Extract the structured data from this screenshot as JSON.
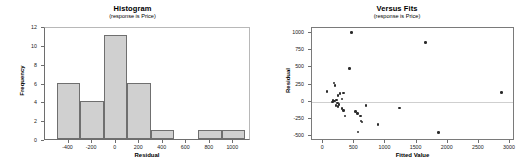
{
  "chart_data": [
    {
      "type": "bar",
      "title": "Histogram",
      "subtitle": "(response is Price)",
      "xlabel": "Residual",
      "ylabel": "Frequency",
      "xlim": [
        -600,
        1150
      ],
      "ylim": [
        0,
        12
      ],
      "grid": false,
      "legend": "none",
      "xticks": [
        "-400",
        "-200",
        "0",
        "200",
        "400",
        "600",
        "800",
        "1000"
      ],
      "xtick_values": [
        -400,
        -200,
        0,
        200,
        400,
        600,
        800,
        1000
      ],
      "yticks": [
        "0",
        "2",
        "4",
        "6",
        "8",
        "10",
        "12"
      ],
      "ytick_values": [
        0,
        2,
        4,
        6,
        8,
        10,
        12
      ],
      "bin_width": 200,
      "bins": [
        {
          "left": -500,
          "right": -300,
          "center": -400,
          "frequency": 6
        },
        {
          "left": -300,
          "right": -100,
          "center": -200,
          "frequency": 4
        },
        {
          "left": -100,
          "right": 100,
          "center": 0,
          "frequency": 11
        },
        {
          "left": 100,
          "right": 300,
          "center": 200,
          "frequency": 6
        },
        {
          "left": 300,
          "right": 500,
          "center": 400,
          "frequency": 1
        },
        {
          "left": 700,
          "right": 900,
          "center": 800,
          "frequency": 1
        },
        {
          "left": 900,
          "right": 1100,
          "center": 1000,
          "frequency": 1
        }
      ],
      "categories": [
        "-400",
        "-200",
        "0",
        "200",
        "400",
        "800",
        "1000"
      ],
      "values": [
        6,
        4,
        11,
        6,
        1,
        1,
        1
      ],
      "bar_fill_color": "#d0d0d0",
      "bar_edge_color": "#6f6f6f"
    },
    {
      "type": "scatter",
      "title": "Versus Fits",
      "subtitle": "(response is Price)",
      "xlabel": "Fitted Value",
      "ylabel": "Residual",
      "xlim": [
        -180,
        3080
      ],
      "ylim": [
        -580,
        1080
      ],
      "grid": false,
      "legend": "none",
      "reference_line_y": 0,
      "xticks": [
        "0",
        "500",
        "1000",
        "1500",
        "2000",
        "2500",
        "3000"
      ],
      "xtick_values": [
        0,
        500,
        1000,
        1500,
        2000,
        2500,
        3000
      ],
      "yticks": [
        "-500",
        "-250",
        "0",
        "250",
        "500",
        "750",
        "1000"
      ],
      "ytick_values": [
        -500,
        -250,
        0,
        250,
        500,
        750,
        1000
      ],
      "point_color": "#2b2b2b",
      "points": [
        {
          "x": 450,
          "y": 1015
        },
        {
          "x": 1640,
          "y": 865
        },
        {
          "x": 425,
          "y": 485
        },
        {
          "x": 175,
          "y": 275
        },
        {
          "x": 190,
          "y": 235
        },
        {
          "x": 60,
          "y": 150
        },
        {
          "x": 330,
          "y": 125
        },
        {
          "x": 270,
          "y": 115
        },
        {
          "x": 235,
          "y": 90
        },
        {
          "x": 2860,
          "y": 130
        },
        {
          "x": 300,
          "y": 35
        },
        {
          "x": 215,
          "y": 25
        },
        {
          "x": 160,
          "y": 15
        },
        {
          "x": 180,
          "y": 5
        },
        {
          "x": 150,
          "y": -5
        },
        {
          "x": 230,
          "y": -20
        },
        {
          "x": 255,
          "y": -45
        },
        {
          "x": 690,
          "y": -55
        },
        {
          "x": 205,
          "y": -60
        },
        {
          "x": 240,
          "y": -70
        },
        {
          "x": 1225,
          "y": -95
        },
        {
          "x": 300,
          "y": -105
        },
        {
          "x": 330,
          "y": -130
        },
        {
          "x": 520,
          "y": -145
        },
        {
          "x": 555,
          "y": -175
        },
        {
          "x": 350,
          "y": -210
        },
        {
          "x": 600,
          "y": -215
        },
        {
          "x": 610,
          "y": -285
        },
        {
          "x": 625,
          "y": -300
        },
        {
          "x": 880,
          "y": -340
        },
        {
          "x": 560,
          "y": -450
        },
        {
          "x": 1855,
          "y": -455
        }
      ]
    }
  ]
}
